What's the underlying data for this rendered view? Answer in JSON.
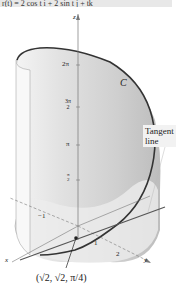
{
  "equation": "r(t) = 2 cos t i + 2 sin t j + tk",
  "curve_label": "C",
  "callout": {
    "line1": "Tangent",
    "line2": "line"
  },
  "axes": {
    "x": "x",
    "y": "y",
    "z": "z"
  },
  "z_ticks": [
    "2π",
    "3π/2",
    "π",
    "π/2"
  ],
  "z_tick_fracs": {
    "three_pi_over_2_num": "3π",
    "three_pi_over_2_den": "2",
    "pi_over_2_num": "π",
    "pi_over_2_den": "2"
  },
  "xy_ticks": {
    "neg_one": "−1",
    "one": "1",
    "two": "2"
  },
  "point_label": "(√2, √2, π/4)",
  "colors": {
    "surface": "#cfcfcf",
    "curve": "#333333",
    "tangent": "#555555",
    "axis": "#888888"
  }
}
